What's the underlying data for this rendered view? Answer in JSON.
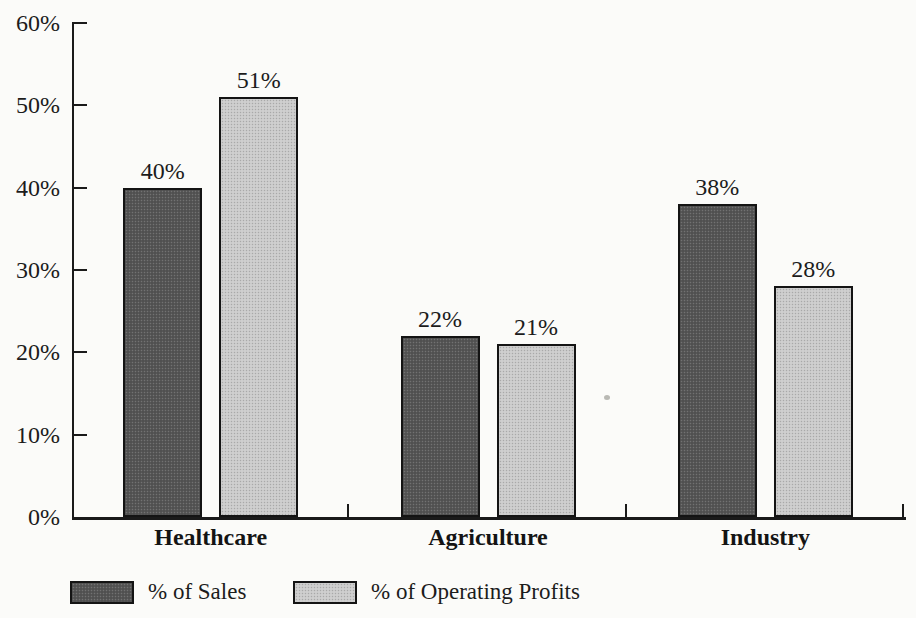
{
  "chart_data": {
    "type": "bar",
    "categories": [
      "Healthcare",
      "Agriculture",
      "Industry"
    ],
    "series": [
      {
        "name": "% of Sales",
        "values": [
          40,
          22,
          38
        ],
        "color": "#575757"
      },
      {
        "name": "% of Operating Profits",
        "values": [
          51,
          21,
          28
        ],
        "color": "#c9c9c9"
      }
    ],
    "value_suffix": "%",
    "yaxis": {
      "tick_values": [
        0,
        10,
        20,
        30,
        40,
        50,
        60
      ],
      "tick_labels": [
        "0%",
        "10%",
        "20%",
        "30%",
        "40%",
        "50%",
        "60%"
      ],
      "min": 0,
      "max": 60,
      "grid": false
    },
    "legend_position": "bottom-left",
    "axis_color": "#1a1a1a"
  }
}
